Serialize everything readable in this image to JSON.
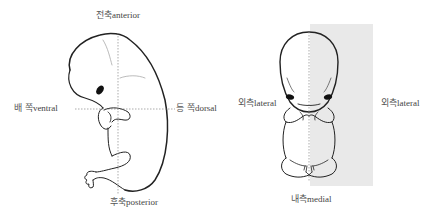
{
  "figure": {
    "shade_color": "#e9e9e9",
    "line_color": "#222222",
    "guide_color": "#888888"
  },
  "side_view": {
    "labels": {
      "top": {
        "ko": "전축",
        "en": "anterior"
      },
      "bottom": {
        "ko": "후축",
        "en": "posterior"
      },
      "left": {
        "ko": "배 쪽",
        "en": "ventral"
      },
      "right": {
        "ko": "등 쪽",
        "en": "dorsal"
      }
    }
  },
  "front_view": {
    "labels": {
      "left": {
        "ko": "외측",
        "en": "lateral"
      },
      "right": {
        "ko": "외측",
        "en": "lateral"
      },
      "bottom": {
        "ko": "내측",
        "en": "medial"
      }
    }
  }
}
